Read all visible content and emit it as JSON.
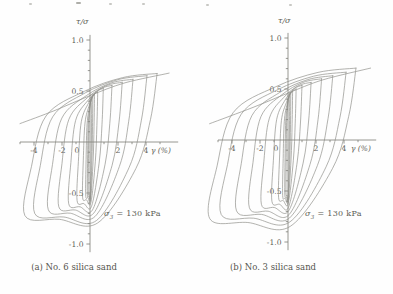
{
  "page": {
    "kind": "scanned-figure",
    "background": "#fefefe"
  },
  "colors": {
    "curve": "#8d8d86",
    "axis": "#7e7e77",
    "text": "#5d5d55"
  },
  "charts": [
    {
      "id": "a",
      "caption": "(a) No. 6 silica sand",
      "annotation": {
        "sym": "σ",
        "sub": "3",
        "rest": " = 130 kPa"
      },
      "chart_data": {
        "type": "line",
        "title": "",
        "xlabel": "γ (%)",
        "ylabel": "τ/σ",
        "xlim": [
          -5,
          6.3
        ],
        "ylim": [
          -1.08,
          1.05
        ],
        "grid": false,
        "legend": "none",
        "x_ticks": [
          {
            "v": -4,
            "label": "-4"
          },
          {
            "v": -2,
            "label": "-2"
          },
          {
            "v": 0,
            "label": "0",
            "dx": -13
          },
          {
            "v": 2,
            "label": "2"
          },
          {
            "v": 4,
            "label": "4"
          }
        ],
        "x_minor": [
          -5,
          -3,
          -1,
          1,
          3,
          5
        ],
        "y_ticks": [
          {
            "v": 1.0,
            "label": "1.0"
          },
          {
            "v": 0.5,
            "label": "0.5"
          },
          {
            "v": -0.5,
            "label": "-0.5"
          },
          {
            "v": -1.0,
            "label": "-1.0"
          }
        ],
        "y_minor_step": 0.1,
        "skeleton": [
          [
            -5.0,
            0.18
          ],
          [
            -2.5,
            0.31
          ],
          [
            0,
            0.455
          ],
          [
            2.5,
            0.58
          ],
          [
            5.65,
            0.675
          ]
        ],
        "loops": [
          {
            "amp_pos": 0.12,
            "amp_neg": 0.12,
            "peak_pos": 0.44,
            "peak_neg": -0.49
          },
          {
            "amp_pos": 0.2,
            "amp_neg": 0.19,
            "peak_pos": 0.455,
            "peak_neg": -0.505
          },
          {
            "amp_pos": 0.32,
            "amp_neg": 0.31,
            "peak_pos": 0.47,
            "peak_neg": -0.52
          },
          {
            "amp_pos": 0.55,
            "amp_neg": 0.53,
            "peak_pos": 0.49,
            "peak_neg": -0.54
          },
          {
            "amp_pos": 0.95,
            "amp_neg": 0.92,
            "peak_pos": 0.525,
            "peak_neg": -0.575
          },
          {
            "amp_pos": 1.57,
            "amp_neg": 1.52,
            "peak_pos": 0.555,
            "peak_neg": -0.605
          },
          {
            "amp_pos": 2.3,
            "amp_neg": 2.23,
            "peak_pos": 0.585,
            "peak_neg": -0.635
          },
          {
            "amp_pos": 3.07,
            "amp_neg": 2.98,
            "peak_pos": 0.615,
            "peak_neg": -0.665
          },
          {
            "amp_pos": 4.07,
            "amp_neg": 3.95,
            "peak_pos": 0.65,
            "peak_neg": -0.7
          },
          {
            "amp_pos": 4.79,
            "amp_neg": 4.65,
            "peak_pos": 0.672,
            "peak_neg": -0.722
          }
        ]
      }
    },
    {
      "id": "b",
      "caption": "(b) No. 3 silica sand",
      "annotation": {
        "sym": "σ",
        "sub": "3",
        "rest": " = 130 kPa"
      },
      "chart_data": {
        "type": "line",
        "title": "",
        "xlabel": "γ (%)",
        "ylabel": "τ/σ",
        "xlim": [
          -5,
          6.3
        ],
        "ylim": [
          -1.08,
          1.05
        ],
        "grid": false,
        "legend": "none",
        "x_ticks": [
          {
            "v": -4,
            "label": "-4"
          },
          {
            "v": -2,
            "label": "-2"
          },
          {
            "v": 0,
            "label": "0",
            "dx": -12
          },
          {
            "v": 2,
            "label": "2"
          },
          {
            "v": 4,
            "label": "4"
          }
        ],
        "x_minor": [
          -5,
          -3,
          -1,
          1,
          3,
          5
        ],
        "y_ticks": [
          {
            "v": 1.0,
            "label": "1.0"
          },
          {
            "v": 0.5,
            "label": "0.5"
          },
          {
            "v": -0.5,
            "label": "-0.5"
          },
          {
            "v": -1.0,
            "label": "-1.0"
          }
        ],
        "y_minor_step": 0.1,
        "skeleton": [
          [
            -5.6,
            0.16
          ],
          [
            -2.5,
            0.32
          ],
          [
            0,
            0.46
          ],
          [
            2.5,
            0.59
          ],
          [
            5.9,
            0.705
          ]
        ],
        "loops": [
          {
            "amp_pos": 0.12,
            "amp_neg": 0.14,
            "peak_pos": 0.45,
            "peak_neg": -0.515
          },
          {
            "amp_pos": 0.2,
            "amp_neg": 0.23,
            "peak_pos": 0.465,
            "peak_neg": -0.53
          },
          {
            "amp_pos": 0.33,
            "amp_neg": 0.38,
            "peak_pos": 0.48,
            "peak_neg": -0.545
          },
          {
            "amp_pos": 0.58,
            "amp_neg": 0.67,
            "peak_pos": 0.5,
            "peak_neg": -0.565
          },
          {
            "amp_pos": 1.0,
            "amp_neg": 1.15,
            "peak_pos": 0.535,
            "peak_neg": -0.6
          },
          {
            "amp_pos": 1.65,
            "amp_neg": 1.9,
            "peak_pos": 0.565,
            "peak_neg": -0.63
          },
          {
            "amp_pos": 2.4,
            "amp_neg": 2.76,
            "peak_pos": 0.6,
            "peak_neg": -0.665
          },
          {
            "amp_pos": 3.2,
            "amp_neg": 3.68,
            "peak_pos": 0.63,
            "peak_neg": -0.695
          },
          {
            "amp_pos": 4.15,
            "amp_neg": 4.77,
            "peak_pos": 0.665,
            "peak_neg": -0.73
          },
          {
            "amp_pos": 4.86,
            "amp_neg": 5.59,
            "peak_pos": 0.705,
            "peak_neg": -0.77
          }
        ]
      }
    }
  ]
}
